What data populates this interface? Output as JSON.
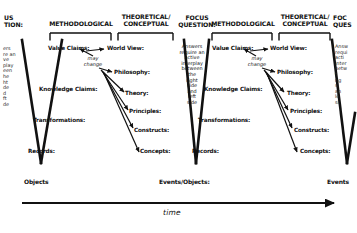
{
  "diagram": {
    "ink_color": "#111111",
    "background": "#ffffff",
    "time_axis": {
      "label": "time",
      "direction": "left-to-right"
    }
  },
  "columns": {
    "focus_question_heading_1": "US\nTION:",
    "methodological_1": "METHODOLOGICAL",
    "theoretical_1": "THEORETICAL/\nCONCEPTUAL",
    "focus_question_heading_2": "FOCUS\nQUESTION:",
    "methodological_2": "METHODOLOGICAL",
    "theoretical_2": "THEORETICAL/\nCONCEPTUAL",
    "focus_question_heading_3": "FOC\nQUES"
  },
  "focus_text": {
    "full": "Answers\nrequire an\nactive\ninterplay\nbetween\nthe\nright\nside\nand\nleft\nside",
    "clipped_left": "ers\nre an\nve\nplay\neen\nhe\nht\nde\nd\nft\nde",
    "clipped_right": "Answ\nrequi\nacti\ninter\nbetw\nt\nrig\nsi\nan\nle\nsi"
  },
  "left_arm": {
    "labels": [
      "Value Claims:",
      "Knowledge Claims:",
      "Transformations:",
      "Records:"
    ]
  },
  "right_arm": {
    "labels": [
      "World View:",
      "Philosophy:",
      "Theory:",
      "Principles:",
      "Constructs:",
      "Concepts:"
    ]
  },
  "annotations": {
    "may_change": "may\nchange"
  },
  "vertices": {
    "v1": "Objects",
    "v2": "Events/Objects:",
    "v3": "Events"
  }
}
